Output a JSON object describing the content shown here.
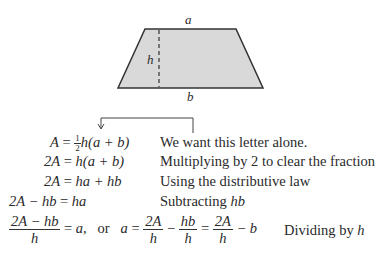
{
  "figure": {
    "shape": "trapezoid",
    "fill_color": "#d9d9d9",
    "stroke_color": "#333333",
    "labels": {
      "top": "a",
      "bottom": "b",
      "height": "h"
    }
  },
  "annotation": {
    "arrow_target": "a",
    "note": "We want this letter alone."
  },
  "steps": [
    {
      "lhs": "A",
      "rhs": "h(a + b)",
      "rhs_prefix_fraction": {
        "num": "1",
        "den": "2"
      },
      "note": "We want this letter alone."
    },
    {
      "lhs": "2A",
      "rhs": "h(a + b)",
      "note": "Multiplying by 2 to clear the fraction"
    },
    {
      "lhs": "2A",
      "rhs": "ha + hb",
      "note": "Using the distributive law"
    },
    {
      "lhs": "2A − hb",
      "rhs": "ha",
      "note_prefix": "Subtracting ",
      "note_var": "hb"
    },
    {
      "frac1": {
        "num": "2A − hb",
        "den": "h"
      },
      "eq1_rhs": "a,",
      "or": "or",
      "a": "a",
      "frac2": {
        "num": "2A",
        "den": "h"
      },
      "frac3": {
        "num": "hb",
        "den": "h"
      },
      "frac4": {
        "num": "2A",
        "den": "h"
      },
      "tail": "− b",
      "note_prefix": "Dividing by ",
      "note_var": "h"
    }
  ]
}
